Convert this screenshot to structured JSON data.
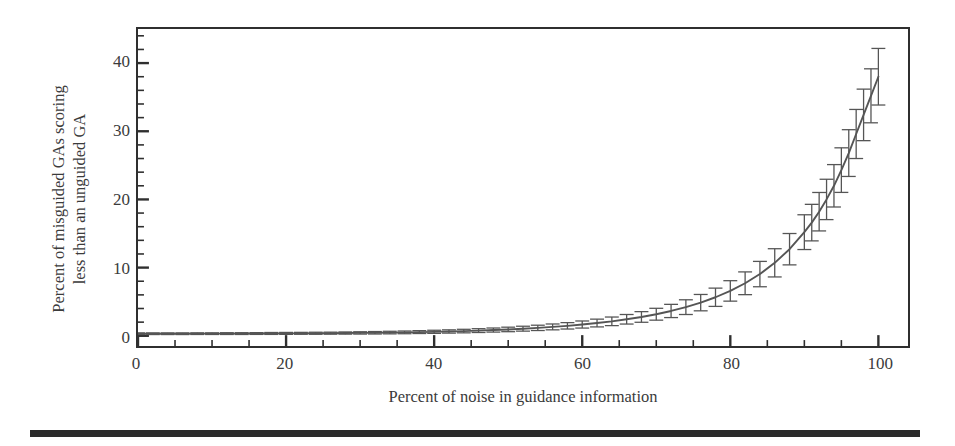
{
  "figure": {
    "background_color": "#ffffff",
    "ink_color": "#3b3b3b",
    "frame_color": "#2f2f2f",
    "curve_color": "#555555",
    "rule_color": "#2b2b2b"
  },
  "axis": {
    "x_label": "Percent of noise in guidance information",
    "y_label_line1": "Percent of misguided GAs scoring",
    "y_label_line2": "less than an unguided GA",
    "x_ticks": [
      0,
      20,
      40,
      60,
      80,
      100
    ],
    "x_tick_labels": [
      "0",
      "20",
      "40",
      "60",
      "80",
      "100"
    ],
    "y_ticks": [
      0,
      10,
      20,
      30,
      40
    ],
    "y_tick_labels": [
      "0",
      "10",
      "20",
      "30",
      "40"
    ],
    "x_minor_step": 5,
    "y_minor_step": 2
  },
  "chart_data": {
    "type": "line",
    "title": "",
    "subtitle": "",
    "xlabel": "Percent of noise in guidance information",
    "ylabel": "Percent of misguided GAs scoring less than an unguided GA",
    "xlim": [
      0,
      104
    ],
    "ylim": [
      -1.5,
      45
    ],
    "grid": false,
    "legend": "none",
    "annotations": [],
    "error_bars": "vertical, symmetric, caps drawn at every sampled point",
    "series": [
      {
        "name": "Misguided GAs below unguided GA",
        "marker": "none",
        "line_style": "solid",
        "x": [
          0,
          2,
          4,
          6,
          8,
          10,
          12,
          14,
          16,
          18,
          20,
          22,
          24,
          26,
          28,
          30,
          32,
          34,
          36,
          38,
          40,
          42,
          44,
          46,
          48,
          50,
          52,
          54,
          56,
          58,
          60,
          62,
          64,
          66,
          68,
          70,
          72,
          74,
          76,
          78,
          80,
          82,
          84,
          86,
          88,
          90,
          91,
          92,
          93,
          94,
          95,
          96,
          97,
          98,
          99,
          100
        ],
        "y": [
          0.3,
          0.3,
          0.3,
          0.3,
          0.31,
          0.31,
          0.32,
          0.32,
          0.33,
          0.34,
          0.35,
          0.36,
          0.37,
          0.38,
          0.4,
          0.42,
          0.44,
          0.47,
          0.5,
          0.54,
          0.58,
          0.63,
          0.69,
          0.76,
          0.84,
          0.93,
          1.04,
          1.16,
          1.3,
          1.46,
          1.65,
          1.87,
          2.12,
          2.42,
          2.76,
          3.16,
          3.64,
          4.2,
          4.86,
          5.65,
          6.58,
          7.7,
          9.05,
          10.7,
          12.7,
          15.2,
          16.6,
          18.2,
          20.0,
          22.0,
          24.3,
          26.8,
          29.6,
          32.4,
          35.2,
          38.0
        ],
        "yerr": [
          0.12,
          0.12,
          0.12,
          0.12,
          0.12,
          0.12,
          0.13,
          0.13,
          0.13,
          0.14,
          0.14,
          0.14,
          0.15,
          0.15,
          0.16,
          0.17,
          0.18,
          0.19,
          0.2,
          0.21,
          0.23,
          0.24,
          0.26,
          0.28,
          0.3,
          0.33,
          0.36,
          0.39,
          0.43,
          0.47,
          0.52,
          0.57,
          0.63,
          0.7,
          0.78,
          0.87,
          0.97,
          1.08,
          1.2,
          1.34,
          1.5,
          1.67,
          1.86,
          2.07,
          2.3,
          2.55,
          2.68,
          2.82,
          2.96,
          3.11,
          3.27,
          3.43,
          3.6,
          3.78,
          3.96,
          4.15
        ]
      }
    ]
  },
  "page": {
    "bottom_rule": "horizontal rule"
  }
}
